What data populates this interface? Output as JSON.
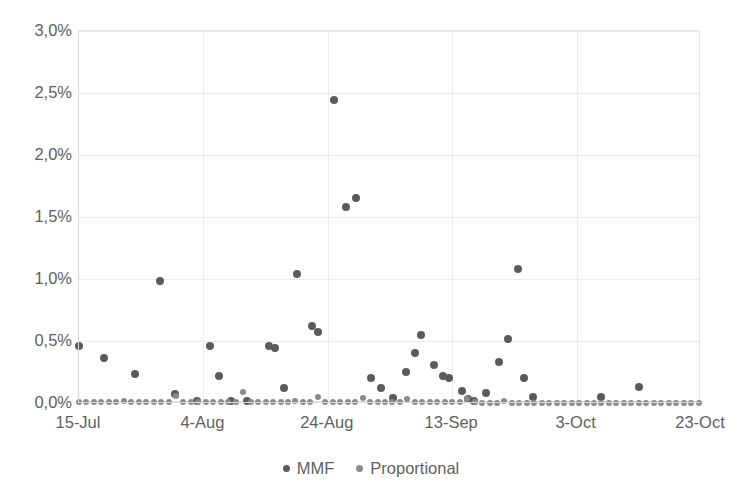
{
  "chart_data": {
    "type": "scatter",
    "title": "",
    "xlabel": "",
    "ylabel": "",
    "ylim": [
      0,
      3.0
    ],
    "ytick_labels": [
      "0,0%",
      "0,5%",
      "1,0%",
      "1,5%",
      "2,0%",
      "2,5%",
      "3,0%"
    ],
    "ytick_values": [
      0.0,
      0.5,
      1.0,
      1.5,
      2.0,
      2.5,
      3.0
    ],
    "xtick_labels": [
      "15-Jul",
      "4-Aug",
      "24-Aug",
      "13-Sep",
      "3-Oct",
      "23-Oct"
    ],
    "xtick_values": [
      0,
      20,
      40,
      60,
      80,
      100
    ],
    "xlim": [
      0,
      100
    ],
    "grid": true,
    "legend_position": "bottom",
    "series": [
      {
        "name": "MMF",
        "color": "#5b5b5b",
        "marker": "circle",
        "points": [
          [
            0.0,
            0.46
          ],
          [
            4.0,
            0.36
          ],
          [
            9.0,
            0.23
          ],
          [
            13.0,
            0.98
          ],
          [
            15.5,
            0.07
          ],
          [
            19.0,
            0.02
          ],
          [
            21.0,
            0.46
          ],
          [
            22.5,
            0.22
          ],
          [
            24.5,
            0.02
          ],
          [
            27.0,
            0.02
          ],
          [
            30.5,
            0.46
          ],
          [
            31.5,
            0.44
          ],
          [
            33.0,
            0.12
          ],
          [
            35.0,
            1.04
          ],
          [
            37.5,
            0.62
          ],
          [
            38.5,
            0.57
          ],
          [
            41.0,
            2.44
          ],
          [
            43.0,
            1.58
          ],
          [
            44.5,
            1.65
          ],
          [
            47.0,
            0.2
          ],
          [
            48.5,
            0.12
          ],
          [
            50.5,
            0.04
          ],
          [
            52.5,
            0.25
          ],
          [
            54.0,
            0.4
          ],
          [
            55.0,
            0.55
          ],
          [
            57.0,
            0.31
          ],
          [
            58.5,
            0.22
          ],
          [
            59.5,
            0.2
          ],
          [
            61.5,
            0.1
          ],
          [
            62.5,
            0.03
          ],
          [
            63.5,
            0.02
          ],
          [
            65.5,
            0.08
          ],
          [
            67.5,
            0.33
          ],
          [
            69.0,
            0.52
          ],
          [
            70.5,
            1.08
          ],
          [
            71.5,
            0.2
          ],
          [
            73.0,
            0.05
          ],
          [
            84.0,
            0.05
          ],
          [
            90.0,
            0.13
          ]
        ]
      },
      {
        "name": "Proportional",
        "color": "#8b8b8b",
        "marker": "circle",
        "points": [
          [
            0.0,
            0.01
          ],
          [
            1.2,
            0.01
          ],
          [
            2.4,
            0.01
          ],
          [
            3.6,
            0.01
          ],
          [
            4.8,
            0.01
          ],
          [
            6.0,
            0.01
          ],
          [
            7.2,
            0.02
          ],
          [
            8.4,
            0.01
          ],
          [
            9.6,
            0.01
          ],
          [
            10.8,
            0.01
          ],
          [
            12.0,
            0.01
          ],
          [
            13.2,
            0.01
          ],
          [
            14.4,
            0.01
          ],
          [
            15.6,
            0.06
          ],
          [
            16.8,
            0.01
          ],
          [
            18.0,
            0.01
          ],
          [
            19.2,
            0.01
          ],
          [
            20.4,
            0.01
          ],
          [
            21.6,
            0.01
          ],
          [
            22.8,
            0.01
          ],
          [
            24.0,
            0.01
          ],
          [
            25.2,
            0.01
          ],
          [
            26.4,
            0.09
          ],
          [
            27.6,
            0.01
          ],
          [
            28.8,
            0.01
          ],
          [
            30.0,
            0.01
          ],
          [
            31.2,
            0.01
          ],
          [
            32.4,
            0.01
          ],
          [
            33.6,
            0.01
          ],
          [
            34.8,
            0.02
          ],
          [
            36.0,
            0.01
          ],
          [
            37.2,
            0.01
          ],
          [
            38.4,
            0.05
          ],
          [
            39.6,
            0.01
          ],
          [
            40.8,
            0.01
          ],
          [
            42.0,
            0.01
          ],
          [
            43.2,
            0.01
          ],
          [
            44.4,
            0.01
          ],
          [
            45.6,
            0.04
          ],
          [
            46.8,
            0.01
          ],
          [
            48.0,
            0.01
          ],
          [
            49.2,
            0.01
          ],
          [
            50.4,
            0.01
          ],
          [
            51.6,
            0.01
          ],
          [
            52.8,
            0.03
          ],
          [
            54.0,
            0.01
          ],
          [
            55.2,
            0.01
          ],
          [
            56.4,
            0.01
          ],
          [
            57.6,
            0.01
          ],
          [
            58.8,
            0.01
          ],
          [
            60.0,
            0.01
          ],
          [
            61.2,
            0.01
          ],
          [
            62.4,
            0.03
          ],
          [
            63.6,
            0.01
          ],
          [
            64.8,
            0.0
          ],
          [
            66.0,
            0.0
          ],
          [
            67.2,
            0.0
          ],
          [
            68.4,
            0.02
          ],
          [
            69.6,
            0.0
          ],
          [
            70.8,
            0.0
          ],
          [
            72.0,
            0.0
          ],
          [
            73.2,
            0.0
          ],
          [
            74.4,
            0.0
          ],
          [
            75.6,
            0.0
          ],
          [
            76.8,
            0.0
          ],
          [
            78.0,
            0.0
          ],
          [
            79.2,
            0.0
          ],
          [
            80.4,
            0.0
          ],
          [
            81.6,
            0.0
          ],
          [
            82.8,
            0.0
          ],
          [
            84.0,
            0.0
          ],
          [
            85.2,
            0.0
          ],
          [
            86.4,
            0.0
          ],
          [
            87.6,
            0.0
          ],
          [
            88.8,
            0.0
          ],
          [
            90.0,
            0.0
          ],
          [
            91.2,
            0.0
          ],
          [
            92.4,
            0.0
          ],
          [
            93.6,
            0.0
          ],
          [
            94.8,
            0.0
          ],
          [
            96.0,
            0.0
          ],
          [
            97.2,
            0.0
          ],
          [
            98.4,
            0.0
          ],
          [
            99.6,
            0.0
          ]
        ]
      }
    ]
  },
  "legend": {
    "items": [
      {
        "label": "MMF",
        "color": "#5b5b5b"
      },
      {
        "label": "Proportional",
        "color": "#8b8b8b"
      }
    ]
  }
}
